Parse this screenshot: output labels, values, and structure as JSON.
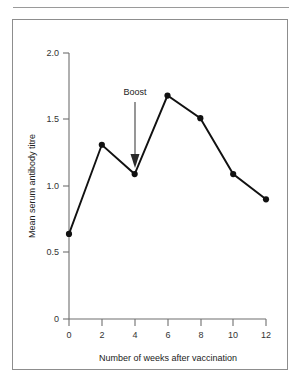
{
  "figure": {
    "frame_border_color": "#8d8d8d",
    "rule_color": "#9a9a9a",
    "background": "#ffffff"
  },
  "chart_data": {
    "type": "line",
    "title": "",
    "xlabel": "Number of weeks after vaccination",
    "ylabel": "Mean serum antibody titre",
    "x": [
      0,
      2,
      4,
      6,
      8,
      10,
      12
    ],
    "values": [
      0.64,
      1.31,
      1.09,
      1.68,
      1.51,
      1.09,
      0.9
    ],
    "series": [
      {
        "name": "Mean serum antibody titre",
        "values": [
          0.64,
          1.31,
          1.09,
          1.68,
          1.51,
          1.09,
          0.9
        ],
        "color": "#111111",
        "marker": "filled-circle"
      }
    ],
    "xlim": [
      0,
      12
    ],
    "ylim": [
      0,
      2.0
    ],
    "xticks": [
      0,
      2,
      4,
      6,
      8,
      10,
      12
    ],
    "xtick_labels": [
      "0",
      "2",
      "4",
      "6",
      "8",
      "10",
      "12"
    ],
    "yticks": [
      0,
      0.5,
      1.0,
      1.5,
      2.0
    ],
    "ytick_labels": [
      "0",
      "0.5",
      "1.0",
      "1.5",
      "2.0"
    ],
    "grid": false,
    "legend": null,
    "annotations": [
      {
        "text": "Boost",
        "x": 4,
        "y": 1.09,
        "arrow": "down",
        "color": "#222222"
      }
    ]
  }
}
